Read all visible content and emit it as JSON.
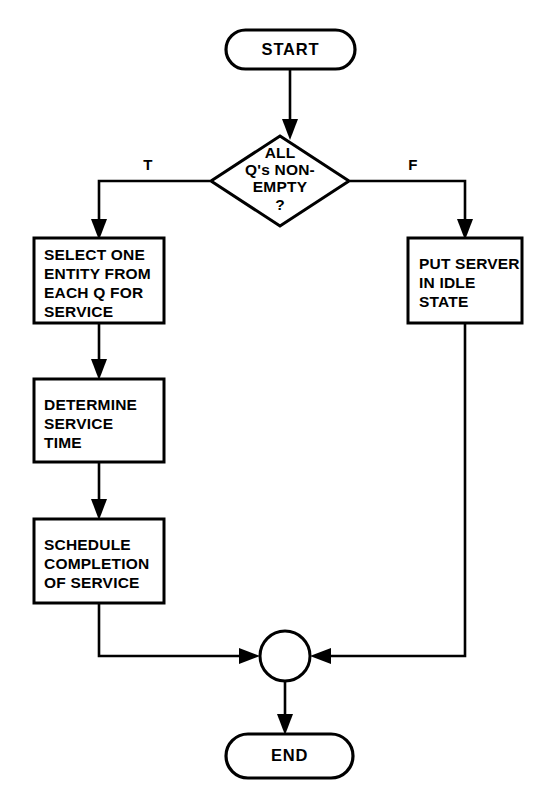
{
  "diagram": {
    "type": "flowchart",
    "background_color": "#ffffff",
    "line_color": "#000000",
    "nodes": {
      "start": {
        "shape": "terminal-oval",
        "label": "START"
      },
      "decision": {
        "shape": "diamond",
        "line1": "ALL",
        "line2": "Q's NON-",
        "line3": "EMPTY",
        "line4": "?"
      },
      "select_entity": {
        "shape": "process-rect",
        "line1": "SELECT ONE",
        "line2": "ENTITY FROM",
        "line3": "EACH Q FOR",
        "line4": "SERVICE"
      },
      "put_server_idle": {
        "shape": "process-rect",
        "line1": "PUT SERVER",
        "line2": "IN IDLE",
        "line3": "STATE"
      },
      "determine_service_time": {
        "shape": "process-rect",
        "line1": "DETERMINE",
        "line2": "SERVICE",
        "line3": "TIME"
      },
      "schedule_completion": {
        "shape": "process-rect",
        "line1": "SCHEDULE",
        "line2": "COMPLETION",
        "line3": "OF SERVICE"
      },
      "merge": {
        "shape": "circle-junction",
        "label": ""
      },
      "end": {
        "shape": "terminal-oval",
        "label": "END"
      }
    },
    "edge_labels": {
      "true_branch": "T",
      "false_branch": "F"
    }
  }
}
